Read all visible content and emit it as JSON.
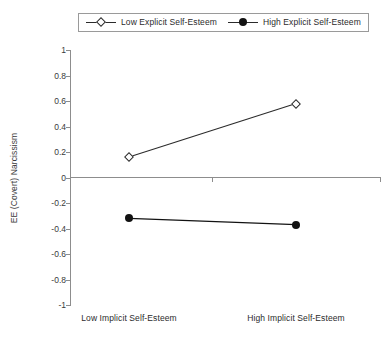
{
  "chart_data": {
    "type": "line",
    "title": "",
    "xlabel": "",
    "ylabel": "EE (Covert) Narcissism",
    "categories": [
      "Low Implicit Self-Esteem",
      "High Implicit Self-Esteem"
    ],
    "ylim": [
      -1,
      1
    ],
    "yticks": [
      1,
      0.8,
      0.6,
      0.4,
      0.2,
      0,
      -0.2,
      -0.4,
      -0.6,
      -0.8,
      -1
    ],
    "ytick_labels": [
      "1",
      "0.8",
      "0.6",
      "0.4",
      "0.2",
      "0",
      "-0.2",
      "-0.4",
      "-0.6",
      "-0.8",
      "-1"
    ],
    "grid": false,
    "legend_position": "top-center",
    "series": [
      {
        "name": "Low Explicit Self-Esteem",
        "marker": "open-diamond",
        "color": "#2b2b2b",
        "values": [
          0.16,
          0.58
        ]
      },
      {
        "name": "High Explicit Self-Esteem",
        "marker": "filled-circle",
        "color": "#121212",
        "values": [
          -0.32,
          -0.37
        ]
      }
    ]
  },
  "legend": {
    "entries": [
      {
        "label": "Low Explicit Self-Esteem",
        "marker": "open-diamond"
      },
      {
        "label": "High Explicit Self-Esteem",
        "marker": "filled-circle"
      }
    ]
  },
  "axes": {
    "y_title": "EE (Covert) Narcissism",
    "y_labels": [
      "1",
      "0.8",
      "0.6",
      "0.4",
      "0.2",
      "0",
      "-0.2",
      "-0.4",
      "-0.6",
      "-0.8",
      "-1"
    ],
    "x_labels": [
      "Low Implicit Self-Esteem",
      "High Implicit Self-Esteem"
    ]
  }
}
